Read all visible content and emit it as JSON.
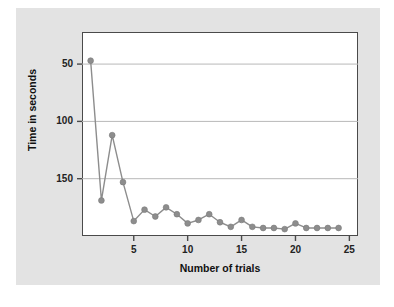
{
  "chart_data": {
    "type": "line",
    "title": "",
    "xlabel": "Number of trials",
    "ylabel": "Time in seconds",
    "xlim": [
      0.2,
      25.8
    ],
    "ylim": [
      0,
      178
    ],
    "xticks": [
      5,
      10,
      15,
      20,
      25
    ],
    "yticks": [
      50,
      100,
      150
    ],
    "grid": "horizontal",
    "legend": "none",
    "marker": "circle",
    "series": [
      {
        "name": "trial time",
        "color": "#8d8d8d",
        "x": [
          1,
          2,
          3,
          4,
          5,
          6,
          7,
          8,
          9,
          10,
          11,
          12,
          13,
          14,
          15,
          16,
          17,
          18,
          19,
          20,
          21,
          22,
          23,
          24
        ],
        "values": [
          153,
          31,
          88,
          47,
          13,
          23,
          17,
          25,
          19,
          11,
          14,
          19,
          12,
          8,
          14,
          8,
          7,
          7,
          6,
          11,
          7,
          7,
          7,
          7
        ]
      }
    ]
  },
  "axis": {
    "y_tick_labels": [
      "150",
      "100",
      "50"
    ],
    "x_tick_labels": [
      "5",
      "10",
      "15",
      "20",
      "25"
    ],
    "y_title": "Time in seconds",
    "x_title": "Number of trials"
  },
  "colors": {
    "card_background": "#e3e3e3",
    "plot_background": "#ffffff",
    "plot_border": "#4a4a4a",
    "series": "#8d8d8d",
    "gridline": "#b8b8b8",
    "text": "#111111"
  }
}
